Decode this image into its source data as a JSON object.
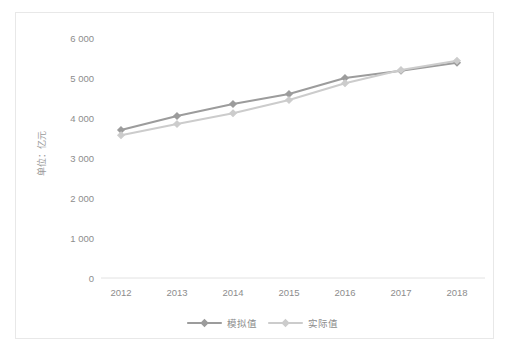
{
  "chart_data": {
    "type": "line",
    "title": "",
    "subtitle": "",
    "xlabel": "",
    "ylabel": "单位：亿元",
    "categories": [
      "2012",
      "2013",
      "2014",
      "2015",
      "2016",
      "2017",
      "2018"
    ],
    "x": [
      2012,
      2013,
      2014,
      2015,
      2016,
      2017,
      2018
    ],
    "ylim": [
      0,
      6000
    ],
    "y_ticks": [
      0,
      1000,
      2000,
      3000,
      4000,
      5000,
      6000
    ],
    "y_tick_labels": [
      "0",
      "1 000",
      "2 000",
      "3 000",
      "4 000",
      "5 000",
      "6 000"
    ],
    "grid": false,
    "legend_position": "bottom",
    "series": [
      {
        "name": "模拟值",
        "color": "#9c9c9c",
        "marker": "diamond",
        "values": [
          3700,
          4050,
          4350,
          4600,
          5000,
          5180,
          5380
        ]
      },
      {
        "name": "实际值",
        "color": "#cccccc",
        "marker": "diamond",
        "values": [
          3570,
          3850,
          4120,
          4450,
          4870,
          5200,
          5430
        ]
      }
    ]
  },
  "colors": {
    "series_1": "#9c9c9c",
    "series_2": "#cccccc",
    "axis": "#e2e2e2",
    "text": "#8d8d8d",
    "frame_border": "#e8e8e8",
    "background": "#ffffff"
  },
  "axis": {
    "y_title": "单位：亿元",
    "y_labels": [
      "6 000",
      "5 000",
      "4 000",
      "3 000",
      "2 000",
      "1 000",
      "0"
    ],
    "x_labels": [
      "2012",
      "2013",
      "2014",
      "2015",
      "2016",
      "2017",
      "2018"
    ]
  },
  "legend": {
    "items": [
      {
        "label": "模拟值"
      },
      {
        "label": "实际值"
      }
    ]
  }
}
